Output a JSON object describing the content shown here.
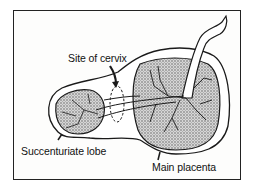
{
  "diagram": {
    "labels": {
      "cervix": "Site of cervix",
      "lobe": "Succenturiate lobe",
      "placenta": "Main placenta"
    },
    "colors": {
      "line": "#1a1a1a",
      "fill": "#bdbdbd",
      "background": "#ffffff"
    }
  }
}
